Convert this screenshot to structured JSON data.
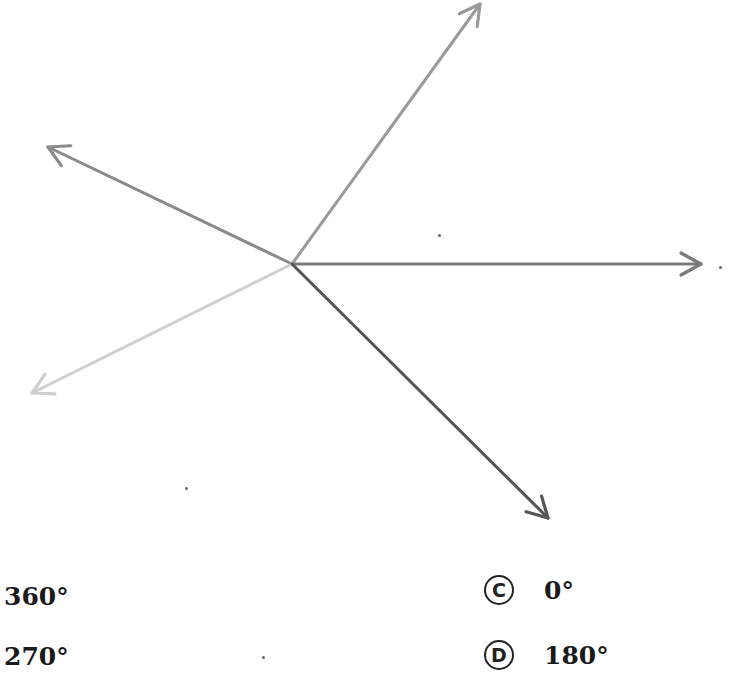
{
  "diagram": {
    "origin": {
      "x": 292,
      "y": 264
    },
    "rays": [
      {
        "name": "ray-up-right",
        "tip": {
          "x": 480,
          "y": 4
        },
        "color": "#9a9a9a"
      },
      {
        "name": "ray-up-left",
        "tip": {
          "x": 48,
          "y": 147
        },
        "color": "#8a8a8a"
      },
      {
        "name": "ray-right",
        "tip": {
          "x": 701,
          "y": 264
        },
        "color": "#7a7a7a"
      },
      {
        "name": "ray-down-left",
        "tip": {
          "x": 32,
          "y": 393
        },
        "color": "#cfcfcf"
      },
      {
        "name": "ray-down-right",
        "tip": {
          "x": 548,
          "y": 518
        },
        "color": "#555555"
      }
    ]
  },
  "choices": [
    {
      "letter": "",
      "value": "360°"
    },
    {
      "letter": "C",
      "value": "0°"
    },
    {
      "letter": "",
      "value": "270°"
    },
    {
      "letter": "D",
      "value": "180°"
    }
  ]
}
